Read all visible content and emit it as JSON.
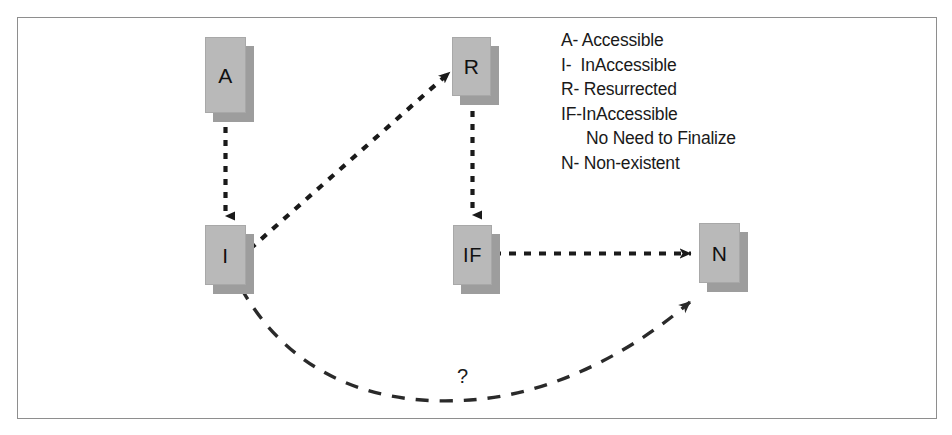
{
  "figure": {
    "border_color": "#8e8e8e",
    "background": "#ffffff",
    "node_fill": "#b9b9b9",
    "node_shadow": "#9d9d9d",
    "edge_color": "#1a1a1a"
  },
  "nodes": [
    {
      "id": "A",
      "label": "A",
      "x": 205,
      "y": 37,
      "w": 41,
      "h": 76
    },
    {
      "id": "I",
      "label": "I",
      "x": 205,
      "y": 225,
      "w": 41,
      "h": 60
    },
    {
      "id": "R",
      "label": "R",
      "x": 452,
      "y": 37,
      "w": 39,
      "h": 59
    },
    {
      "id": "IF",
      "label": "IF",
      "x": 453,
      "y": 225,
      "w": 39,
      "h": 60
    },
    {
      "id": "N",
      "label": "N",
      "x": 699,
      "y": 223,
      "w": 41,
      "h": 60
    }
  ],
  "edges": [
    {
      "id": "a-to-i",
      "from": "A",
      "to": "N/A:I",
      "style": "dashed",
      "arrows": "end"
    },
    {
      "id": "i-to-r",
      "from": "I",
      "to": "R",
      "style": "dashed",
      "arrows": "both"
    },
    {
      "id": "r-to-if",
      "from": "R",
      "to": "IF",
      "style": "dashed",
      "arrows": "end"
    },
    {
      "id": "if-to-n",
      "from": "IF",
      "to": "N",
      "style": "dashed",
      "arrows": "end"
    },
    {
      "id": "i-to-n",
      "from": "I",
      "to": "N",
      "style": "dashed-curved",
      "arrows": "end",
      "label": "?"
    }
  ],
  "edge_label": {
    "question_mark": "?"
  },
  "legend": {
    "lines": [
      {
        "text": "A- Accessible",
        "indent": false
      },
      {
        "text": "I-  InAccessible",
        "indent": false
      },
      {
        "text": "R- Resurrected",
        "indent": false
      },
      {
        "text": "IF-InAccessible",
        "indent": false
      },
      {
        "text": "No Need to Finalize",
        "indent": true
      },
      {
        "text": "N- Non-existent",
        "indent": false
      }
    ]
  }
}
